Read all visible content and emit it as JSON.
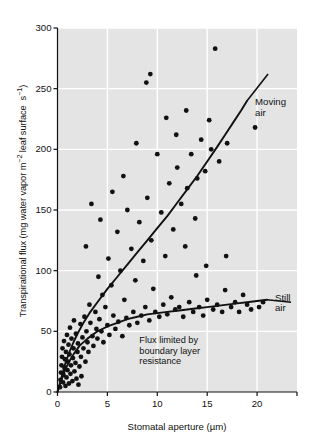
{
  "chart_data": {
    "type": "scatter",
    "title": "",
    "xlabel": "Stomatal aperture (µm)",
    "ylabel": "Transpirational flux (mg water vapor m⁻² leaf surface s⁻¹)",
    "xlim": [
      0,
      24
    ],
    "ylim": [
      0,
      300
    ],
    "xticks": [
      0,
      5,
      10,
      15,
      20
    ],
    "xticklabels": [
      "0",
      "5",
      "10",
      "15",
      "20"
    ],
    "yticks": [
      0,
      50,
      100,
      150,
      200,
      250,
      300
    ],
    "yticklabels": [
      "0",
      "50",
      "100",
      "150",
      "200",
      "250",
      "300"
    ],
    "grid": true,
    "grid_color": "#ffffff",
    "plot_background": "#e4e4e4",
    "marker_color": "#111111",
    "line_color": "#111111",
    "legend_position": "inline-annotations",
    "annotations": [
      {
        "name": "moving-air",
        "text": "Moving\nair",
        "x": 19.8,
        "y": 238
      },
      {
        "name": "still-air",
        "text": "Still\nair",
        "x": 21.8,
        "y": 77
      },
      {
        "name": "boundary-layer-note",
        "text": "Flux limited by\nboundary layer\nresistance",
        "x": 8.2,
        "y": 42
      }
    ],
    "series": [
      {
        "name": "moving-air-fit",
        "type": "line",
        "points": [
          [
            0.0,
            0
          ],
          [
            0.4,
            12
          ],
          [
            0.8,
            24
          ],
          [
            1.2,
            33
          ],
          [
            1.6,
            41
          ],
          [
            2.0,
            48
          ],
          [
            2.6,
            57
          ],
          [
            3.2,
            65
          ],
          [
            4.0,
            74
          ],
          [
            5.0,
            85
          ],
          [
            6.0,
            95
          ],
          [
            7.0,
            105
          ],
          [
            8.0,
            115
          ],
          [
            9.0,
            125
          ],
          [
            10.0,
            135
          ],
          [
            11.0,
            145
          ],
          [
            12.0,
            156
          ],
          [
            13.0,
            167
          ],
          [
            14.0,
            178
          ],
          [
            15.0,
            190
          ],
          [
            16.0,
            202
          ],
          [
            16.8,
            212
          ],
          [
            17.6,
            222
          ],
          [
            18.4,
            232
          ],
          [
            19.0,
            240
          ]
        ]
      },
      {
        "name": "still-air-fit",
        "type": "line",
        "points": [
          [
            0.0,
            0
          ],
          [
            0.3,
            8
          ],
          [
            0.7,
            17
          ],
          [
            1.1,
            24
          ],
          [
            1.6,
            31
          ],
          [
            2.2,
            38
          ],
          [
            3.0,
            44
          ],
          [
            4.0,
            50
          ],
          [
            5.0,
            54
          ],
          [
            6.0,
            57
          ],
          [
            7.0,
            60
          ],
          [
            8.0,
            62
          ],
          [
            9.0,
            64
          ],
          [
            10.0,
            65
          ],
          [
            11.0,
            66
          ],
          [
            12.0,
            67
          ],
          [
            13.0,
            68
          ],
          [
            14.0,
            69
          ],
          [
            15.0,
            70
          ],
          [
            16.0,
            71
          ],
          [
            17.0,
            72
          ],
          [
            18.0,
            73
          ],
          [
            19.0,
            74
          ],
          [
            20.0,
            75
          ],
          [
            21.0,
            76
          ]
        ]
      },
      {
        "name": "observations",
        "type": "scatter",
        "points": [
          [
            0.25,
            4
          ],
          [
            0.3,
            10
          ],
          [
            0.35,
            16
          ],
          [
            0.4,
            22
          ],
          [
            0.45,
            29
          ],
          [
            0.5,
            36
          ],
          [
            0.55,
            8
          ],
          [
            0.6,
            14
          ],
          [
            0.65,
            42
          ],
          [
            0.7,
            20
          ],
          [
            0.75,
            27
          ],
          [
            0.8,
            5
          ],
          [
            0.85,
            33
          ],
          [
            0.9,
            12
          ],
          [
            0.95,
            47
          ],
          [
            1.0,
            18
          ],
          [
            1.05,
            25
          ],
          [
            1.1,
            39
          ],
          [
            1.15,
            7
          ],
          [
            1.2,
            31
          ],
          [
            1.25,
            53
          ],
          [
            1.3,
            15
          ],
          [
            1.35,
            22
          ],
          [
            1.4,
            44
          ],
          [
            1.5,
            9
          ],
          [
            1.55,
            28
          ],
          [
            1.6,
            36
          ],
          [
            1.65,
            59
          ],
          [
            1.7,
            17
          ],
          [
            1.8,
            24
          ],
          [
            1.85,
            48
          ],
          [
            1.9,
            11
          ],
          [
            2.0,
            33
          ],
          [
            2.05,
            40
          ],
          [
            2.1,
            6
          ],
          [
            2.2,
            21
          ],
          [
            2.3,
            56
          ],
          [
            2.35,
            29
          ],
          [
            2.4,
            13
          ],
          [
            2.5,
            45
          ],
          [
            2.6,
            36
          ],
          [
            2.7,
            62
          ],
          [
            2.8,
            25
          ],
          [
            2.9,
            50
          ],
          [
            3.0,
            41
          ],
          [
            3.1,
            33
          ],
          [
            3.2,
            72
          ],
          [
            3.3,
            57
          ],
          [
            3.5,
            46
          ],
          [
            3.6,
            38
          ],
          [
            3.8,
            66
          ],
          [
            3.9,
            52
          ],
          [
            4.0,
            44
          ],
          [
            4.1,
            95
          ],
          [
            4.2,
            60
          ],
          [
            4.4,
            50
          ],
          [
            4.5,
            80
          ],
          [
            4.6,
            41
          ],
          [
            4.8,
            70
          ],
          [
            5.0,
            55
          ],
          [
            5.1,
            110
          ],
          [
            5.2,
            47
          ],
          [
            5.4,
            88
          ],
          [
            5.6,
            63
          ],
          [
            5.8,
            52
          ],
          [
            6.0,
            132
          ],
          [
            6.1,
            58
          ],
          [
            6.3,
            100
          ],
          [
            6.5,
            46
          ],
          [
            6.7,
            76
          ],
          [
            6.9,
            61
          ],
          [
            7.0,
            150
          ],
          [
            7.2,
            55
          ],
          [
            7.4,
            118
          ],
          [
            7.6,
            66
          ],
          [
            7.8,
            92
          ],
          [
            8.0,
            57
          ],
          [
            8.2,
            140
          ],
          [
            8.4,
            63
          ],
          [
            8.6,
            108
          ],
          [
            8.8,
            70
          ],
          [
            9.0,
            160
          ],
          [
            9.2,
            59
          ],
          [
            9.4,
            125
          ],
          [
            9.6,
            85
          ],
          [
            9.8,
            66
          ],
          [
            10.0,
            196
          ],
          [
            10.2,
            62
          ],
          [
            10.4,
            148
          ],
          [
            10.6,
            72
          ],
          [
            10.8,
            112
          ],
          [
            11.0,
            64
          ],
          [
            11.2,
            172
          ],
          [
            11.4,
            78
          ],
          [
            11.6,
            134
          ],
          [
            11.8,
            68
          ],
          [
            12.0,
            185
          ],
          [
            12.2,
            70
          ],
          [
            12.4,
            155
          ],
          [
            12.6,
            62
          ],
          [
            12.8,
            120
          ],
          [
            13.0,
            168
          ],
          [
            13.2,
            74
          ],
          [
            13.4,
            196
          ],
          [
            13.6,
            66
          ],
          [
            13.8,
            143
          ],
          [
            14.0,
            176
          ],
          [
            14.2,
            70
          ],
          [
            14.4,
            208
          ],
          [
            14.6,
            63
          ],
          [
            14.8,
            182
          ],
          [
            15.0,
            76
          ],
          [
            15.2,
            224
          ],
          [
            15.4,
            200
          ],
          [
            15.6,
            68
          ],
          [
            15.8,
            283
          ],
          [
            16.0,
            72
          ],
          [
            16.2,
            190
          ],
          [
            16.5,
            66
          ],
          [
            16.8,
            84
          ],
          [
            17.0,
            205
          ],
          [
            17.4,
            70
          ],
          [
            17.8,
            74
          ],
          [
            18.2,
            66
          ],
          [
            18.6,
            80
          ],
          [
            19.0,
            72
          ],
          [
            19.4,
            68
          ],
          [
            19.8,
            218
          ],
          [
            20.2,
            70
          ],
          [
            20.6,
            74
          ],
          [
            3.4,
            155
          ],
          [
            4.3,
            142
          ],
          [
            2.85,
            120
          ],
          [
            5.5,
            165
          ],
          [
            6.6,
            178
          ],
          [
            8.9,
            255
          ],
          [
            9.3,
            262
          ],
          [
            11.9,
            212
          ],
          [
            12.9,
            232
          ],
          [
            13.9,
            96
          ],
          [
            14.9,
            104
          ],
          [
            16.9,
            112
          ],
          [
            7.9,
            205
          ],
          [
            10.9,
            226
          ]
        ]
      }
    ]
  }
}
